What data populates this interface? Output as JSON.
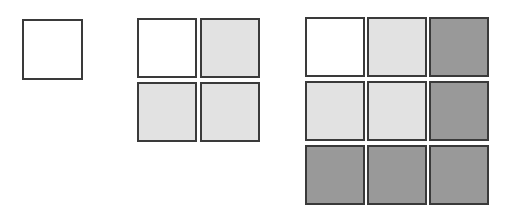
{
  "figure": {
    "background_color": "#ffffff",
    "border_color": "#3a3a3a",
    "border_width_px": 2,
    "palette": {
      "white": "#ffffff",
      "light_gray": "#e2e2e2",
      "dark_gray": "#999999"
    }
  },
  "groups": [
    {
      "id": "group-1",
      "label": "1x1",
      "rows": 1,
      "columns": 2,
      "columns_actual": 1,
      "cell_size_px": 61,
      "cells": [
        {
          "row": 1,
          "col": 1,
          "shade": "white",
          "color": "#ffffff"
        }
      ]
    },
    {
      "id": "group-2",
      "label": "2x2",
      "rows": 2,
      "columns": 2,
      "cell_size_px": 60,
      "cells": [
        {
          "row": 1,
          "col": 1,
          "shade": "white",
          "color": "#ffffff"
        },
        {
          "row": 1,
          "col": 2,
          "shade": "light",
          "color": "#e2e2e2"
        },
        {
          "row": 2,
          "col": 1,
          "shade": "light",
          "color": "#e2e2e2"
        },
        {
          "row": 2,
          "col": 2,
          "shade": "light",
          "color": "#e2e2e2"
        }
      ]
    },
    {
      "id": "group-3",
      "label": "3x3",
      "rows": 3,
      "columns": 3,
      "cell_size_px": 60,
      "cells": [
        {
          "row": 1,
          "col": 1,
          "shade": "white",
          "color": "#ffffff"
        },
        {
          "row": 1,
          "col": 2,
          "shade": "light",
          "color": "#e2e2e2"
        },
        {
          "row": 1,
          "col": 3,
          "shade": "dark",
          "color": "#999999"
        },
        {
          "row": 2,
          "col": 1,
          "shade": "light",
          "color": "#e2e2e2"
        },
        {
          "row": 2,
          "col": 2,
          "shade": "light",
          "color": "#e2e2e2"
        },
        {
          "row": 2,
          "col": 3,
          "shade": "dark",
          "color": "#999999"
        },
        {
          "row": 3,
          "col": 1,
          "shade": "dark",
          "color": "#999999"
        },
        {
          "row": 3,
          "col": 2,
          "shade": "dark",
          "color": "#999999"
        },
        {
          "row": 3,
          "col": 3,
          "shade": "dark",
          "color": "#999999"
        }
      ]
    }
  ]
}
